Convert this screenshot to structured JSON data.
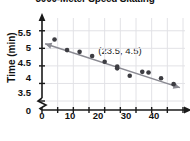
{
  "chart_data": {
    "type": "scatter",
    "title": "3000-Meter Speed Skating",
    "xlabel": "Years since 1960",
    "ylabel": "Time (min)",
    "xlim": [
      0,
      45
    ],
    "ylim": [
      3.5,
      5.75
    ],
    "grid": true,
    "legend": false,
    "xticks": [
      0,
      10,
      20,
      30,
      40
    ],
    "xtick_labels": [
      "0",
      "10",
      "20",
      "30",
      "40"
    ],
    "yticks": [
      3.5,
      4,
      4.5,
      5,
      5.5
    ],
    "ytick_labels": [
      "3.5",
      "4",
      "4.5",
      "5",
      "5.5"
    ],
    "y_axis_break": true,
    "y_axis_origin_label": "0",
    "x": [
      4,
      8,
      12,
      16,
      20,
      24,
      24,
      28,
      32,
      34,
      38,
      42
    ],
    "y": [
      5.25,
      4.95,
      4.9,
      4.78,
      4.62,
      4.48,
      4.43,
      4.22,
      4.33,
      4.31,
      4.15,
      3.98
    ],
    "points": [
      {
        "x": 4,
        "y": 5.25
      },
      {
        "x": 8,
        "y": 4.95
      },
      {
        "x": 12,
        "y": 4.9
      },
      {
        "x": 16,
        "y": 4.78
      },
      {
        "x": 20,
        "y": 4.62
      },
      {
        "x": 24,
        "y": 4.48
      },
      {
        "x": 24,
        "y": 4.43
      },
      {
        "x": 28,
        "y": 4.22
      },
      {
        "x": 32,
        "y": 4.33
      },
      {
        "x": 34,
        "y": 4.31
      },
      {
        "x": 38,
        "y": 4.15
      },
      {
        "x": 42,
        "y": 3.98
      }
    ],
    "trend_line": {
      "x_start": 1,
      "y_start": 5.13,
      "x_end": 44,
      "y_end": 3.88,
      "slope": -0.029,
      "intercept": 5.159
    },
    "annotations": [
      {
        "text": "(23.5, 4.5)",
        "x": 25,
        "y": 4.78
      }
    ],
    "colors": {
      "point": "#3d3d42",
      "line": "#8a8a92",
      "grid": "#e2e2e6",
      "axis": "#1a1a1a",
      "text": "#111111",
      "background": "#ffffff"
    }
  },
  "ticks": {
    "y": [
      "5.5",
      "5",
      "4.5",
      "4",
      "3.5",
      "0"
    ],
    "x": [
      "0",
      "10",
      "20",
      "30",
      "40"
    ]
  },
  "labels": {
    "title": "3000-Meter Speed Skating",
    "ylabel": "Time (min)",
    "xlabel": "Years since 1960",
    "annotation": "(23.5, 4.5)"
  }
}
